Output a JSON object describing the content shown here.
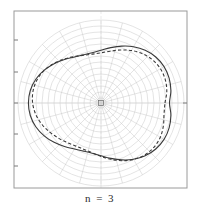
{
  "figure": {
    "caption": "n = 3",
    "frame": {
      "x0": 14,
      "y0": 11,
      "x1": 187,
      "y1": 188,
      "color": "#9a9a9a"
    },
    "center": {
      "x": 101,
      "y": 103
    },
    "axis_tick_color": "#7a7a7a",
    "grid_color": "#c9c9c9",
    "curve_color": "#3a3a3a"
  },
  "chart_data": {
    "type": "line",
    "title": "",
    "subtitle": "",
    "xlabel": "",
    "ylabel": "",
    "annotations": [
      "n = 3"
    ],
    "coordinate_system": "polar",
    "grid": true,
    "legend": "none",
    "polar_grid": {
      "radial_spoke_count": 24,
      "radial_spoke_step_deg": 15,
      "circle_radii": [
        5,
        11,
        17,
        23,
        29,
        35,
        41,
        47,
        53,
        59,
        65,
        71,
        77,
        83
      ],
      "max_radius": 83
    },
    "axis_ticks": {
      "left_border_y": [
        40,
        72,
        103,
        134,
        166
      ],
      "right_border_y": [
        103
      ],
      "top_border_x": [],
      "bottom_border_x": []
    },
    "series": [
      {
        "name": "solid-curve",
        "style": "solid",
        "color": "#3a3a3a",
        "closed": true,
        "form": "r = a + b*cos(3*(theta - phi))",
        "a": 62,
        "b": 11,
        "phase_deg": 115,
        "theta": [
          0,
          10,
          20,
          30,
          40,
          50,
          60,
          70,
          80,
          90,
          100,
          110,
          120,
          130,
          140,
          150,
          160,
          170,
          180,
          190,
          200,
          210,
          220,
          230,
          240,
          250,
          260,
          270,
          280,
          290,
          300,
          310,
          320,
          330,
          340,
          350
        ],
        "r": [
          68.5,
          71.0,
          72.5,
          72.8,
          71.5,
          68.8,
          65.0,
          60.5,
          56.2,
          52.8,
          51.0,
          51.2,
          53.2,
          56.8,
          61.2,
          65.6,
          69.4,
          71.8,
          72.6,
          71.8,
          69.4,
          65.6,
          61.2,
          56.8,
          53.2,
          51.2,
          51.0,
          52.8,
          56.2,
          60.5,
          65.0,
          68.8,
          71.5,
          72.8,
          72.5,
          71.0
        ]
      },
      {
        "name": "dashed-curve",
        "style": "dashed",
        "color": "#3a3a3a",
        "closed": true,
        "form": "r = a + b*cos(3*(theta - phi))",
        "a": 60,
        "b": 9,
        "phase_deg": 95,
        "theta": [
          0,
          10,
          20,
          30,
          40,
          50,
          60,
          70,
          80,
          90,
          100,
          110,
          120,
          130,
          140,
          150,
          160,
          170,
          180,
          190,
          200,
          210,
          220,
          230,
          240,
          250,
          260,
          270,
          280,
          290,
          300,
          310,
          320,
          330,
          340,
          350
        ],
        "r": [
          64.0,
          66.8,
          68.4,
          68.6,
          67.2,
          64.4,
          60.6,
          56.4,
          52.6,
          50.2,
          49.6,
          50.8,
          53.6,
          57.4,
          61.6,
          65.4,
          68.0,
          69.0,
          68.4,
          66.2,
          62.8,
          58.8,
          55.0,
          51.8,
          49.8,
          49.4,
          50.6,
          53.4,
          57.2,
          61.4,
          65.2,
          67.9,
          69.0,
          68.5,
          66.4,
          64.0
        ]
      }
    ]
  }
}
